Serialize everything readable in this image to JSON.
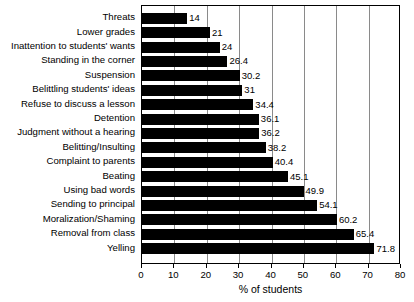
{
  "chart_data": {
    "type": "bar",
    "orientation": "horizontal",
    "title": "",
    "xlabel": "% of students",
    "ylabel": "",
    "xlim": [
      0,
      80
    ],
    "xticks": [
      0,
      10,
      20,
      30,
      40,
      50,
      60,
      70,
      80
    ],
    "grid": true,
    "legend": null,
    "bar_color": "#000000",
    "categories": [
      "Threats",
      "Lower grades",
      "Inattention to students' wants",
      "Standing in the corner",
      "Suspension",
      "Belittling students' ideas",
      "Refuse to discuss a lesson",
      "Detention",
      "Judgment without a hearing",
      "Belitting/Insulting",
      "Complaint to parents",
      "Beating",
      "Using bad words",
      "Sending to principal",
      "Moralization/Shaming",
      "Removal from class",
      "Yelling"
    ],
    "values": [
      14,
      21,
      24,
      26.4,
      30.2,
      31,
      34.4,
      36.1,
      36.2,
      38.2,
      40.4,
      45.1,
      49.9,
      54.1,
      60.2,
      65.4,
      71.8
    ],
    "value_labels": [
      "14",
      "21",
      "24",
      "26.4",
      "30.2",
      "31",
      "34.4",
      "36.1",
      "36.2",
      "38.2",
      "40.4",
      "45.1",
      "49.9",
      "54.1",
      "60.2",
      "65.4",
      "71.8"
    ]
  }
}
